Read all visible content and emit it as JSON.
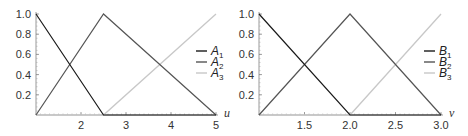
{
  "chart_data": [
    {
      "type": "line",
      "title": "",
      "xlabel": "u",
      "ylabel": "",
      "xlim": [
        1,
        5
      ],
      "ylim": [
        0,
        1
      ],
      "x_ticks": [
        "2",
        "3",
        "4",
        "5"
      ],
      "y_ticks": [
        "0.2",
        "0.4",
        "0.6",
        "0.8",
        "1.0"
      ],
      "grid": false,
      "legend_position": "right",
      "series": [
        {
          "name": "A1",
          "label_main": "A",
          "label_sub": "1",
          "color": "#1a1a1a",
          "x": [
            1,
            2.5,
            5
          ],
          "y": [
            1,
            0,
            0
          ]
        },
        {
          "name": "A2",
          "label_main": "A",
          "label_sub": "2",
          "color": "#555555",
          "x": [
            1,
            2.5,
            5
          ],
          "y": [
            0,
            1,
            0
          ]
        },
        {
          "name": "A3",
          "label_main": "A",
          "label_sub": "3",
          "color": "#c8c8c8",
          "x": [
            1,
            2.5,
            5
          ],
          "y": [
            0,
            0,
            1
          ]
        }
      ]
    },
    {
      "type": "line",
      "title": "",
      "xlabel": "v",
      "ylabel": "",
      "xlim": [
        1,
        3
      ],
      "ylim": [
        0,
        1
      ],
      "x_ticks": [
        "1.5",
        "2.0",
        "2.5",
        "3.0"
      ],
      "y_ticks": [
        "0.2",
        "0.4",
        "0.6",
        "0.8",
        "1.0"
      ],
      "grid": false,
      "legend_position": "right",
      "series": [
        {
          "name": "B1",
          "label_main": "B",
          "label_sub": "1",
          "color": "#1a1a1a",
          "x": [
            1,
            2,
            3
          ],
          "y": [
            1,
            0,
            0
          ]
        },
        {
          "name": "B2",
          "label_main": "B",
          "label_sub": "2",
          "color": "#555555",
          "x": [
            1,
            2,
            3
          ],
          "y": [
            0,
            1,
            0
          ]
        },
        {
          "name": "B3",
          "label_main": "B",
          "label_sub": "3",
          "color": "#c8c8c8",
          "x": [
            1,
            2,
            3
          ],
          "y": [
            0,
            0,
            1
          ]
        }
      ]
    }
  ]
}
